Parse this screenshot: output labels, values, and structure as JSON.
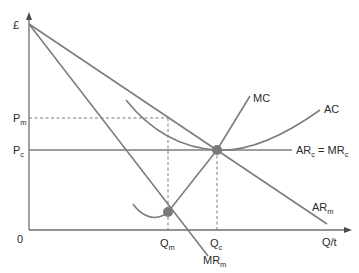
{
  "diagram": {
    "type": "economics-monopoly-vs-competition",
    "y_axis": {
      "label": "£"
    },
    "x_axis": {
      "label": "Q/t",
      "origin_label": "0"
    },
    "price_levels": [
      {
        "id": "Pm",
        "base": "P",
        "sub": "m",
        "style": "dashed"
      },
      {
        "id": "Pc",
        "base": "P",
        "sub": "c",
        "style": "solid"
      }
    ],
    "quantity_levels": [
      {
        "id": "Qm",
        "base": "Q",
        "sub": "m",
        "style": "dashed"
      },
      {
        "id": "Qc",
        "base": "Q",
        "sub": "c",
        "style": "dashed"
      }
    ],
    "curves": {
      "mc": {
        "label": "MC"
      },
      "ac": {
        "label": "AC"
      },
      "arc_mrc": {
        "base1": "AR",
        "sub1": "c",
        "eq": " = ",
        "base2": "MR",
        "sub2": "c"
      },
      "arm": {
        "base": "AR",
        "sub": "m"
      },
      "mrm": {
        "base": "MR",
        "sub": "m"
      }
    },
    "equilibria": [
      {
        "id": "monopoly",
        "description": "MC = MRm at Qm"
      },
      {
        "id": "competitive",
        "description": "MC = AC = ARc at Qc"
      }
    ],
    "colors": {
      "line": "#7d7d7d",
      "axis": "#6e6e6e",
      "point": "#7a7a7a",
      "text": "#2a2a2a"
    }
  }
}
